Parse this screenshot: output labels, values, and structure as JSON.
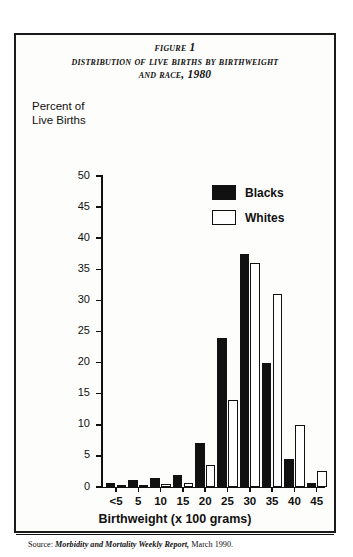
{
  "figure": {
    "title_line_1": "Figure 1",
    "title_line_2": "Distribution of Live Births by Birthweight",
    "title_line_3": "and Race, 1980",
    "y_caption_line_1": "Percent of",
    "y_caption_line_2": "Live Births",
    "source_label": "Source:",
    "source_italic": "Morbidity and Mortality Weekly Report,",
    "source_tail": "March 1990."
  },
  "chart_data": {
    "type": "bar",
    "title": "Distribution of Live Births by Birthweight and Race, 1980",
    "xlabel": "Birthweight (x 100 grams)",
    "ylabel": "Percent of Live Births",
    "ylim": [
      0,
      50
    ],
    "yticks": [
      0,
      5,
      10,
      15,
      20,
      25,
      30,
      35,
      40,
      45,
      50
    ],
    "ytick_labels": [
      "0",
      "5",
      "10",
      "15",
      "20",
      "25",
      "30",
      "35",
      "40",
      "45",
      "50"
    ],
    "grid": false,
    "legend_position": "upper-right",
    "categories": [
      "<5",
      "5",
      "10",
      "15",
      "20",
      "25",
      "30",
      "35",
      "40",
      "45"
    ],
    "series": [
      {
        "name": "Blacks",
        "color": "#111111",
        "values": [
          0.6,
          1.2,
          1.5,
          2.0,
          7.0,
          24.0,
          37.5,
          20.0,
          4.5,
          0.7
        ]
      },
      {
        "name": "Whites",
        "color": "#ffffff",
        "values": [
          0.2,
          0.3,
          0.5,
          0.7,
          3.5,
          14.0,
          36.0,
          31.0,
          10.0,
          2.5
        ]
      }
    ]
  }
}
